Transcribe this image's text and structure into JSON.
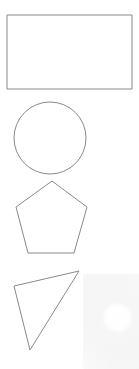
{
  "canvas": {
    "width": 139,
    "height": 369,
    "background_color": "#ffffff",
    "description": "Four outlined geometric shapes stacked vertically"
  },
  "style": {
    "stroke_color": "#8a8a8a",
    "stroke_width": 1,
    "fill": "none"
  },
  "shapes": [
    {
      "id": "rectangle",
      "label": "Rectangle",
      "type": "rect",
      "x": 7,
      "y": 15,
      "width": 125,
      "height": 74,
      "stroke_color": "#8a8a8a"
    },
    {
      "id": "circle",
      "label": "Circle",
      "type": "circle",
      "cx": 50,
      "cy": 138,
      "r": 36,
      "stroke_color": "#8a8a8a"
    },
    {
      "id": "pentagon",
      "label": "Pentagon",
      "type": "polygon",
      "points": "52,181 87,207 74,253 28,253 16,207",
      "stroke_color": "#8a8a8a"
    },
    {
      "id": "triangle",
      "label": "Triangle",
      "type": "polygon",
      "points": "79,271 14,286 30,350",
      "stroke_color": "#8a8a8a"
    }
  ]
}
